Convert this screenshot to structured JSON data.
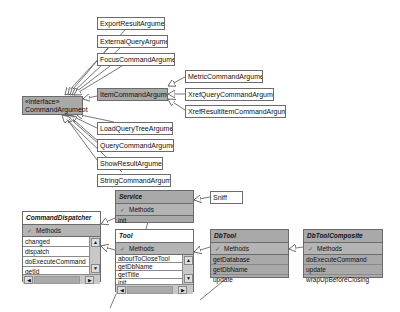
{
  "interface": {
    "stereotype": "«interface»",
    "name": "CommandArgument"
  },
  "arguments": {
    "export_result": "ExportResultArgument",
    "external_query": "ExternalQueryArgument",
    "focus_command": "FocusCommandArgument",
    "item_command": "ItemCommandArgument",
    "load_query_tree": "LoadQueryTreeArgument",
    "query_command": "QueryCommandArgument",
    "show_result": "ShowResultArgument",
    "string_command": "StringCommandArgument",
    "metric_command": "MetricCommandArgument",
    "xref_query_command": "XrefQueryCommandArgument",
    "xref_result_item_command": "XrefResultItemCommandArgument"
  },
  "service": {
    "name": "Service",
    "section": "Methods",
    "methods": [
      "init"
    ]
  },
  "sniff": {
    "name": "Sniff"
  },
  "command_dispatcher": {
    "name": "CommandDispatcher",
    "section": "Methods",
    "methods": [
      "changed",
      "dispatch",
      "doExecuteCommand",
      "getId"
    ]
  },
  "tool": {
    "name": "Tool",
    "section": "Methods",
    "methods": [
      "aboutToCloseTool",
      "getDbName",
      "getTitle",
      "init"
    ]
  },
  "db_tool": {
    "name": "DbTool",
    "section": "Methods",
    "methods": [
      "getDatabase",
      "getDbName",
      "update"
    ]
  },
  "db_tool_composite": {
    "name": "DbToolComposite",
    "section": "Methods",
    "methods": [
      "doExecuteCommand",
      "update",
      "wrapUpBeforeClosing"
    ]
  },
  "icons": {
    "toggle": "✓",
    "scroll_up": "▲",
    "scroll_down": "▼",
    "scroll_left": "◀",
    "scroll_right": "▶"
  }
}
